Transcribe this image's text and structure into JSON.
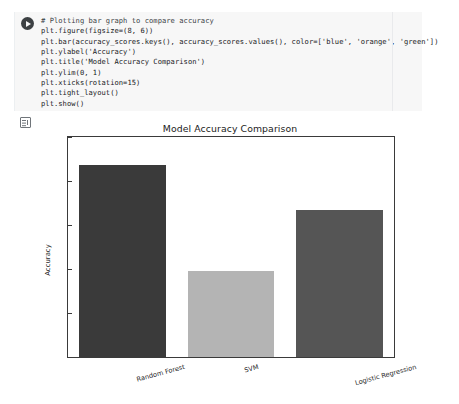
{
  "notebook": {
    "run_button_label": "run-cell",
    "output_icon_label": "output-cell-icon",
    "code_lines": [
      "# Plotting bar graph to compare accuracy",
      "plt.figure(figsize=(8, 6))",
      "plt.bar(accuracy_scores.keys(), accuracy_scores.values(), color=['blue', 'orange', 'green'])",
      "plt.ylabel('Accuracy')",
      "plt.title('Model Accuracy Comparison')",
      "plt.ylim(0, 1)",
      "plt.xticks(rotation=15)",
      "plt.tight_layout()",
      "plt.show()"
    ]
  },
  "chart_data": {
    "type": "bar",
    "title": "Model Accuracy Comparison",
    "xlabel": "",
    "ylabel": "Accuracy",
    "categories": [
      "Random Forest",
      "SVM",
      "Logistic Regression"
    ],
    "values": [
      0.872,
      0.392,
      0.667
    ],
    "colors": [
      "#3a3a3a",
      "#b4b4b4",
      "#555555"
    ],
    "ylim": [
      0.0,
      1.0
    ],
    "yticks": [
      0.0,
      0.2,
      0.4,
      0.6,
      0.8,
      1.0
    ],
    "ytick_labels": [
      "0.0",
      "0.2",
      "0.4",
      "0.6",
      "0.8",
      "1.0"
    ],
    "grid": false,
    "legend": "none",
    "xtick_rotation": 15
  }
}
